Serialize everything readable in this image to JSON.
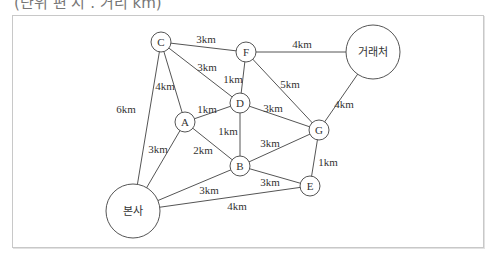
{
  "header": {
    "cut_title": "(단위 편 시 . 거리 km)"
  },
  "nodes": [
    {
      "id": "C",
      "label": "C",
      "x": 161,
      "y": 42,
      "r": 10
    },
    {
      "id": "F",
      "label": "F",
      "x": 246,
      "y": 52,
      "r": 10
    },
    {
      "id": "client",
      "label": "거래처",
      "x": 373,
      "y": 52,
      "r": 27
    },
    {
      "id": "D",
      "label": "D",
      "x": 240,
      "y": 103,
      "r": 10
    },
    {
      "id": "A",
      "label": "A",
      "x": 185,
      "y": 122,
      "r": 10
    },
    {
      "id": "G",
      "label": "G",
      "x": 319,
      "y": 130,
      "r": 10
    },
    {
      "id": "B",
      "label": "B",
      "x": 240,
      "y": 166,
      "r": 10
    },
    {
      "id": "E",
      "label": "E",
      "x": 310,
      "y": 186,
      "r": 10
    },
    {
      "id": "hq",
      "label": "본사",
      "x": 133,
      "y": 211,
      "r": 27
    }
  ],
  "edges": [
    {
      "from": "C",
      "to": "F",
      "label": "3km",
      "lx": 206,
      "ly": 39
    },
    {
      "from": "C",
      "to": "D",
      "label": "3km",
      "lx": 207,
      "ly": 67
    },
    {
      "from": "C",
      "to": "A",
      "label": "4km",
      "lx": 165,
      "ly": 86
    },
    {
      "from": "C",
      "to": "hq",
      "label": "6km",
      "lx": 126,
      "ly": 109
    },
    {
      "from": "F",
      "to": "client",
      "label": "4km",
      "lx": 302,
      "ly": 44
    },
    {
      "from": "F",
      "to": "D",
      "label": "1km",
      "lx": 233,
      "ly": 79
    },
    {
      "from": "F",
      "to": "G",
      "label": "5km",
      "lx": 290,
      "ly": 84
    },
    {
      "from": "client",
      "to": "G",
      "label": "4km",
      "lx": 344,
      "ly": 104
    },
    {
      "from": "A",
      "to": "D",
      "label": "1km",
      "lx": 207,
      "ly": 109
    },
    {
      "from": "D",
      "to": "G",
      "label": "3km",
      "lx": 273,
      "ly": 108
    },
    {
      "from": "D",
      "to": "B",
      "label": "1km",
      "lx": 228,
      "ly": 131
    },
    {
      "from": "A",
      "to": "B",
      "label": "2km",
      "lx": 203,
      "ly": 150
    },
    {
      "from": "A",
      "to": "hq",
      "label": "3km",
      "lx": 158,
      "ly": 149
    },
    {
      "from": "B",
      "to": "G",
      "label": "3km",
      "lx": 270,
      "ly": 143
    },
    {
      "from": "G",
      "to": "E",
      "label": "1km",
      "lx": 328,
      "ly": 162
    },
    {
      "from": "B",
      "to": "E",
      "label": "3km",
      "lx": 270,
      "ly": 182
    },
    {
      "from": "B",
      "to": "hq",
      "label": "3km",
      "lx": 209,
      "ly": 190
    },
    {
      "from": "hq",
      "to": "E",
      "label": "4km",
      "lx": 237,
      "ly": 206
    }
  ]
}
